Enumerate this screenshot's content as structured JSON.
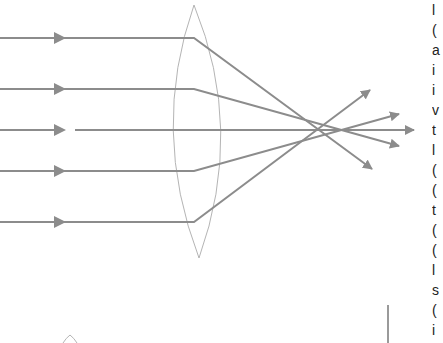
{
  "figure": {
    "type": "converging-lens-ray-diagram",
    "colors": {
      "ray": "#8c8c8c",
      "lens": "#b4b4b4",
      "background": "#ffffff",
      "edge_text": "#222222"
    },
    "lens": {
      "top": [
        194,
        5
      ],
      "bottom": [
        199,
        258
      ],
      "left_bulge_x": 172,
      "right_bulge_x": 221
    },
    "rays": [
      {
        "y": 38,
        "bend_x": 194,
        "tip": [
          372,
          169
        ]
      },
      {
        "y": 89,
        "bend_x": 194,
        "tip": [
          399,
          146
        ]
      },
      {
        "y": 130,
        "bend_x": null,
        "tip": [
          414,
          130
        ]
      },
      {
        "y": 171,
        "bend_x": 194,
        "tip": [
          399,
          114
        ]
      },
      {
        "y": 222,
        "bend_x": 194,
        "tip": [
          370,
          90
        ]
      }
    ],
    "second_lens_fragment": {
      "apex": [
        70,
        335
      ]
    },
    "bar_fragment": {
      "x": 388,
      "y1": 305,
      "y2": 343
    }
  },
  "edge_text_fragments": [
    "l",
    "(",
    "a",
    "i",
    "i",
    "v",
    "t",
    "l",
    "(",
    "(",
    "t",
    "(",
    "(",
    "l",
    "s",
    "(",
    "i",
    "s"
  ]
}
